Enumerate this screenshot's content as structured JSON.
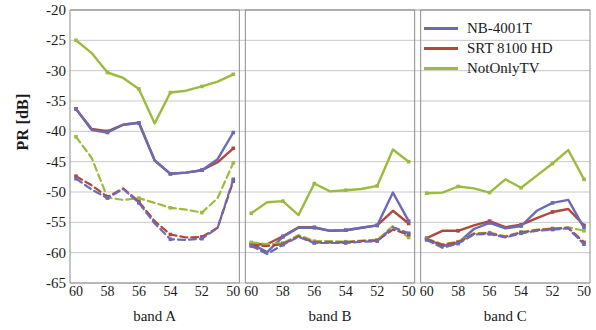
{
  "chart_data": {
    "type": "line",
    "title": "",
    "xlabel": "",
    "ylabel": "PR [dB]",
    "ylim": [
      -65,
      -20
    ],
    "yticks": [
      -20,
      -25,
      -30,
      -35,
      -40,
      -45,
      -50,
      -55,
      -60,
      -65
    ],
    "grid": true,
    "legend_position": "top-right",
    "panels": [
      {
        "name": "band A",
        "x": [
          60,
          59,
          58,
          57,
          56,
          55,
          54,
          53,
          52,
          51,
          50
        ],
        "xticks": [
          60,
          58,
          56,
          54,
          52,
          50
        ],
        "series": [
          {
            "name": "NotOnlyTV",
            "style": "solid",
            "color": "#9cbb3e",
            "values": [
              -25.0,
              -27.1,
              -30.3,
              -31.2,
              -33.0,
              -38.7,
              -33.6,
              -33.3,
              -32.6,
              -31.8,
              -30.6
            ]
          },
          {
            "name": "SRT 8100 HD",
            "style": "solid",
            "color": "#b0483c",
            "values": [
              -36.3,
              -39.6,
              -40.0,
              -38.9,
              -38.6,
              -44.8,
              -47.0,
              -46.8,
              -46.4,
              -45.1,
              -42.8
            ]
          },
          {
            "name": "NB-4001T",
            "style": "solid",
            "color": "#6b6bb5",
            "values": [
              -36.3,
              -39.8,
              -40.2,
              -38.9,
              -38.6,
              -44.8,
              -47.0,
              -46.8,
              -46.4,
              -44.6,
              -40.2
            ]
          },
          {
            "name": "NotOnlyTV",
            "style": "dashed",
            "color": "#9cbb3e",
            "values": [
              -40.9,
              -44.4,
              -50.9,
              -51.3,
              -51.0,
              -51.8,
              -52.6,
              -52.9,
              -53.4,
              -51.0,
              -45.2
            ]
          },
          {
            "name": "SRT 8100 HD",
            "style": "dashed",
            "color": "#b0483c",
            "values": [
              -47.4,
              -48.9,
              -50.8,
              -49.4,
              -51.6,
              -54.8,
              -57.0,
              -57.5,
              -57.4,
              -55.9,
              -48.2
            ]
          },
          {
            "name": "NB-4001T",
            "style": "dashed",
            "color": "#6b6bb5",
            "values": [
              -47.8,
              -49.6,
              -51.0,
              -49.5,
              -51.8,
              -55.2,
              -57.8,
              -57.9,
              -57.7,
              -55.9,
              -47.9
            ]
          }
        ]
      },
      {
        "name": "band B",
        "x": [
          60,
          59,
          58,
          57,
          56,
          55,
          54,
          53,
          52,
          51,
          50
        ],
        "xticks": [
          60,
          58,
          56,
          54,
          52,
          50
        ],
        "series": [
          {
            "name": "NotOnlyTV",
            "style": "solid",
            "color": "#9cbb3e",
            "values": [
              -53.5,
              -51.7,
              -51.5,
              -53.8,
              -48.6,
              -49.9,
              -49.7,
              -49.5,
              -49.0,
              -43.0,
              -45.0
            ]
          },
          {
            "name": "SRT 8100 HD",
            "style": "solid",
            "color": "#b0483c",
            "values": [
              -58.6,
              -58.6,
              -57.3,
              -55.8,
              -55.8,
              -56.4,
              -56.3,
              -55.9,
              -55.5,
              -53.1,
              -55.2
            ]
          },
          {
            "name": "NB-4001T",
            "style": "solid",
            "color": "#6b6bb5",
            "values": [
              -58.5,
              -59.9,
              -57.4,
              -55.9,
              -55.9,
              -56.4,
              -56.3,
              -55.9,
              -55.5,
              -50.1,
              -54.8
            ]
          },
          {
            "name": "NotOnlyTV",
            "style": "dashed",
            "color": "#9cbb3e",
            "values": [
              -58.3,
              -58.6,
              -58.4,
              -57.1,
              -58.1,
              -58.1,
              -58.2,
              -58.0,
              -57.9,
              -55.6,
              -57.5
            ]
          },
          {
            "name": "SRT 8100 HD",
            "style": "dashed",
            "color": "#b0483c",
            "values": [
              -58.8,
              -58.9,
              -58.6,
              -57.3,
              -58.3,
              -58.3,
              -58.3,
              -58.1,
              -58.0,
              -56.2,
              -57.0
            ]
          },
          {
            "name": "NB-4001T",
            "style": "dashed",
            "color": "#6b6bb5",
            "values": [
              -58.9,
              -60.2,
              -58.7,
              -57.4,
              -58.4,
              -58.4,
              -58.4,
              -58.2,
              -58.1,
              -55.8,
              -56.8
            ]
          }
        ]
      },
      {
        "name": "band C",
        "x": [
          60,
          59,
          58,
          57,
          56,
          55,
          54,
          53,
          52,
          51,
          50
        ],
        "xticks": [
          60,
          58,
          56,
          54,
          52,
          50
        ],
        "series": [
          {
            "name": "NotOnlyTV",
            "style": "solid",
            "color": "#9cbb3e",
            "values": [
              -50.2,
              -50.1,
              -49.1,
              -49.4,
              -50.1,
              -47.9,
              -49.3,
              -47.3,
              -45.3,
              -43.1,
              -47.9
            ]
          },
          {
            "name": "SRT 8100 HD",
            "style": "solid",
            "color": "#b0483c",
            "values": [
              -57.6,
              -56.4,
              -56.4,
              -55.5,
              -54.8,
              -55.8,
              -55.4,
              -54.3,
              -53.3,
              -52.8,
              -55.5
            ]
          },
          {
            "name": "NB-4001T",
            "style": "solid",
            "color": "#6b6bb5",
            "values": [
              -57.7,
              -58.9,
              -58.4,
              -56.1,
              -55.1,
              -56.0,
              -55.6,
              -53.1,
              -51.8,
              -51.3,
              -55.9
            ]
          },
          {
            "name": "NotOnlyTV",
            "style": "dashed",
            "color": "#9cbb3e",
            "values": [
              -57.7,
              -58.6,
              -58.2,
              -56.8,
              -56.7,
              -57.3,
              -56.6,
              -56.2,
              -56.0,
              -55.8,
              -56.4
            ]
          },
          {
            "name": "SRT 8100 HD",
            "style": "dashed",
            "color": "#b0483c",
            "values": [
              -57.8,
              -58.7,
              -58.3,
              -56.9,
              -56.8,
              -57.4,
              -56.7,
              -56.3,
              -56.1,
              -55.9,
              -58.3
            ]
          },
          {
            "name": "NB-4001T",
            "style": "dashed",
            "color": "#6b6bb5",
            "values": [
              -57.9,
              -59.2,
              -58.5,
              -57.0,
              -56.9,
              -57.5,
              -56.8,
              -56.4,
              -56.2,
              -56.0,
              -58.6
            ]
          }
        ]
      }
    ],
    "legend": [
      {
        "label": "NB-4001T",
        "color": "#6b6bb5"
      },
      {
        "label": "SRT 8100 HD",
        "color": "#b0483c"
      },
      {
        "label": "NotOnlyTV",
        "color": "#9cbb3e"
      }
    ]
  }
}
